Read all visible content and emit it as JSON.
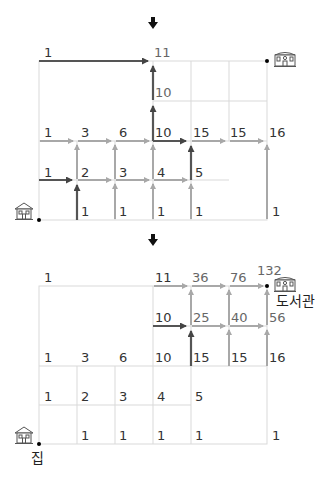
{
  "diagram": {
    "colors": {
      "grid": "#d9d9d9",
      "arrow_light": "#a8a8a8",
      "arrow_dark": "#555555",
      "text": "#333333"
    },
    "top_panel": {
      "labels": {
        "r0c0": "1",
        "r0c3": "11",
        "r1c3": "10",
        "r2c0": "1",
        "r2c1": "3",
        "r2c2": "6",
        "r2c3": "10",
        "r2c4": "15",
        "r2c5": "15",
        "r2c6": "16",
        "r3c0": "1",
        "r3c1": "2",
        "r3c2": "3",
        "r3c3": "4",
        "r3c4": "5",
        "r4c1": "1",
        "r4c2": "1",
        "r4c3": "1",
        "r4c4": "1",
        "r4c6": "1"
      }
    },
    "bottom_panel": {
      "labels": {
        "r0c0": "1",
        "r0c3": "11",
        "r0c4": "36",
        "r0c5": "76",
        "r0c6": "132",
        "r1c3": "10",
        "r1c4": "25",
        "r1c5": "40",
        "r1c6": "56",
        "r2c0": "1",
        "r2c1": "3",
        "r2c2": "6",
        "r2c3": "10",
        "r2c4": "15",
        "r2c5": "15",
        "r2c6": "16",
        "r3c0": "1",
        "r3c1": "2",
        "r3c2": "3",
        "r3c3": "4",
        "r3c4": "5",
        "r4c1": "1",
        "r4c2": "1",
        "r4c3": "1",
        "r4c4": "1",
        "r4c6": "1"
      },
      "home_label": "집",
      "library_label": "도서관"
    },
    "icons": {
      "home": "house-icon",
      "library": "library-building-icon",
      "step": "down-arrow-icon"
    }
  }
}
